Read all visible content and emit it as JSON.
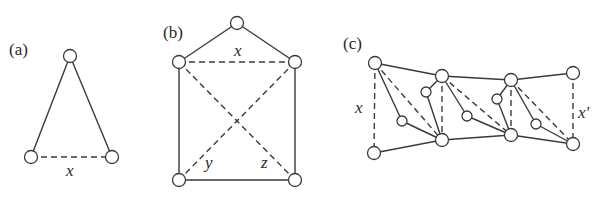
{
  "figure": {
    "panels": [
      {
        "id": "a",
        "label": "(a)",
        "label_pos": [
          9,
          55
        ],
        "node_radius": 6.5,
        "nodes": [
          [
            70,
            56
          ],
          [
            31,
            157
          ],
          [
            112,
            157
          ]
        ],
        "solid_edges": [
          [
            0,
            1
          ],
          [
            0,
            2
          ]
        ],
        "dashed_edges": [
          [
            1,
            2
          ]
        ],
        "var_labels": [
          {
            "text": "x",
            "pos": [
              66,
              176
            ]
          }
        ]
      },
      {
        "id": "b",
        "label": "(b)",
        "label_pos": [
          163,
          38
        ],
        "node_radius": 6.5,
        "nodes": [
          [
            237,
            23
          ],
          [
            179,
            62
          ],
          [
            295,
            62
          ],
          [
            179,
            180
          ],
          [
            295,
            180
          ]
        ],
        "solid_edges": [
          [
            0,
            1
          ],
          [
            0,
            2
          ],
          [
            1,
            3
          ],
          [
            2,
            4
          ],
          [
            3,
            4
          ]
        ],
        "dashed_edges": [
          [
            1,
            2
          ],
          [
            1,
            4
          ],
          [
            2,
            3
          ]
        ],
        "var_labels": [
          {
            "text": "x",
            "pos": [
              234,
              56
            ]
          },
          {
            "text": "y",
            "pos": [
              205,
              168
            ]
          },
          {
            "text": "z",
            "pos": [
              261,
              168
            ]
          }
        ]
      },
      {
        "id": "c",
        "label": "(c)",
        "label_pos": [
          343,
          49
        ],
        "node_radius": 6.5,
        "small_node_radius": 5,
        "nodes": [
          [
            375,
            63
          ],
          [
            374,
            153
          ],
          [
            442,
            76
          ],
          [
            442,
            140
          ],
          [
            511,
            80
          ],
          [
            511,
            135
          ],
          [
            573,
            73
          ],
          [
            573,
            144
          ]
        ],
        "small_nodes": [
          [
            402,
            121
          ],
          [
            426,
            92
          ],
          [
            467,
            116
          ],
          [
            497,
            99
          ],
          [
            536,
            124
          ]
        ],
        "solid_edges": [
          [
            [
              375,
              63
            ],
            [
              442,
              76
            ]
          ],
          [
            [
              442,
              76
            ],
            [
              511,
              80
            ]
          ],
          [
            [
              511,
              80
            ],
            [
              573,
              73
            ]
          ],
          [
            [
              374,
              153
            ],
            [
              442,
              140
            ]
          ],
          [
            [
              442,
              140
            ],
            [
              511,
              135
            ]
          ],
          [
            [
              511,
              135
            ],
            [
              573,
              144
            ]
          ],
          [
            [
              375,
              63
            ],
            [
              402,
              121
            ]
          ],
          [
            [
              402,
              121
            ],
            [
              442,
              140
            ]
          ],
          [
            [
              442,
              76
            ],
            [
              426,
              92
            ]
          ],
          [
            [
              426,
              92
            ],
            [
              442,
              140
            ]
          ],
          [
            [
              442,
              76
            ],
            [
              467,
              116
            ]
          ],
          [
            [
              467,
              116
            ],
            [
              511,
              135
            ]
          ],
          [
            [
              511,
              80
            ],
            [
              497,
              99
            ]
          ],
          [
            [
              497,
              99
            ],
            [
              511,
              135
            ]
          ],
          [
            [
              511,
              80
            ],
            [
              536,
              124
            ]
          ],
          [
            [
              536,
              124
            ],
            [
              573,
              144
            ]
          ]
        ],
        "dashed_edges": [
          [
            [
              375,
              63
            ],
            [
              374,
              153
            ]
          ],
          [
            [
              375,
              63
            ],
            [
              442,
              140
            ]
          ],
          [
            [
              442,
              76
            ],
            [
              442,
              140
            ]
          ],
          [
            [
              442,
              76
            ],
            [
              511,
              135
            ]
          ],
          [
            [
              511,
              80
            ],
            [
              511,
              135
            ]
          ],
          [
            [
              511,
              80
            ],
            [
              573,
              144
            ]
          ],
          [
            [
              573,
              73
            ],
            [
              573,
              144
            ]
          ]
        ],
        "var_labels": [
          {
            "text": "x",
            "pos": [
              355,
              113
            ]
          },
          {
            "text": "x'",
            "pos": [
              578,
              118
            ]
          }
        ]
      }
    ]
  }
}
